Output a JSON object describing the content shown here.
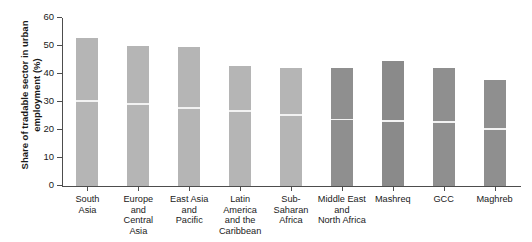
{
  "chart_data": {
    "type": "bar",
    "title": "",
    "subtitle": "",
    "xlabel": "",
    "ylabel": "Share of tradable sector in urban\nemployment (%)",
    "ylim": [
      0,
      60
    ],
    "yticks": [
      0,
      10,
      20,
      30,
      40,
      50,
      60
    ],
    "ytick_labels": [
      "0",
      "10",
      "20",
      "30",
      "40",
      "50",
      "60"
    ],
    "grid": false,
    "legend": null,
    "categories": [
      "South\nAsia",
      "Europe\nand\nCentral\nAsia",
      "East Asia\nand\nPacific",
      "Latin\nAmerica\nand the\nCaribbean",
      "Sub-\nSaharan\nAfrica",
      "Middle East\nand\nNorth Africa",
      "Mashreq",
      "GCC",
      "Maghreb"
    ],
    "values": [
      53,
      50,
      49.5,
      43,
      42,
      42,
      44.5,
      42,
      38
    ],
    "divider_values": [
      30,
      29,
      27.5,
      26.5,
      25,
      23.5,
      23,
      22.5,
      20
    ],
    "bar_colors": [
      "#b5b5b5",
      "#b5b5b5",
      "#b5b5b5",
      "#b5b5b5",
      "#b5b5b5",
      "#8f8f8f",
      "#8a8a8a",
      "#8f8f8f",
      "#8f8f8f"
    ],
    "divider_color": "#f2f2f2",
    "axis_color": "#4d4d4d",
    "background": "#ffffff"
  }
}
